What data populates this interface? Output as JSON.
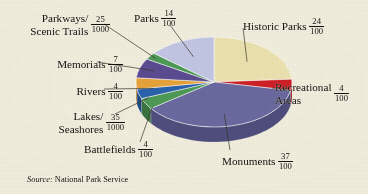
{
  "figure": {
    "background_color": "#f2efdf",
    "source_prefix": "Source:",
    "source_text": "National Park Service"
  },
  "chart_data": {
    "type": "pie",
    "title": "",
    "subtitle": "",
    "xlabel": "",
    "ylabel": "",
    "legend_position": "callout-labels",
    "grid": false,
    "three_d": true,
    "note": "Fractions of U.S. National Park System units by category; values given as printed fractions.",
    "categories": [
      "Historic Parks",
      "Recreational Areas",
      "Monuments",
      "Battlefields",
      "Lakes/ Seashores",
      "Rivers",
      "Memorials",
      "Parkways/ Scenic Trails",
      "Parks"
    ],
    "values": [
      0.24,
      0.04,
      0.37,
      0.04,
      0.035,
      0.04,
      0.07,
      0.025,
      0.14
    ],
    "labels_fraction": [
      "24/100",
      "4/100",
      "37/100",
      "4/100",
      "35/1000",
      "4/100",
      "7/100",
      "25/1000",
      "14/100"
    ],
    "colors": [
      "#ece3b0",
      "#cf2026",
      "#6b6aa0",
      "#4e9a56",
      "#2a62ad",
      "#e8a43a",
      "#5b4b91",
      "#4e9a56",
      "#c3c6e4"
    ],
    "slices": [
      {
        "name": "Historic Parks",
        "numerator": "24",
        "denominator": "100",
        "value": 0.24,
        "color": "#ece3b0",
        "side_color": "#d6cb92"
      },
      {
        "name": "Recreational Areas",
        "name_line1": "Recreational",
        "name_line2": "Areas",
        "numerator": "4",
        "denominator": "100",
        "value": 0.04,
        "color": "#cf2026",
        "side_color": "#9c161b"
      },
      {
        "name": "Monuments",
        "numerator": "37",
        "denominator": "100",
        "value": 0.37,
        "color": "#6b6aa0",
        "side_color": "#4f4e7d"
      },
      {
        "name": "Battlefields",
        "numerator": "4",
        "denominator": "100",
        "value": 0.04,
        "color": "#4e9a56",
        "side_color": "#3a7440"
      },
      {
        "name": "Lakes/ Seashores",
        "name_line1": "Lakes/",
        "name_line2": "Seashores",
        "numerator": "35",
        "denominator": "1000",
        "value": 0.035,
        "color": "#2a62ad",
        "side_color": "#1f4a84"
      },
      {
        "name": "Rivers",
        "numerator": "4",
        "denominator": "100",
        "value": 0.04,
        "color": "#e8a43a",
        "side_color": "#b87c26"
      },
      {
        "name": "Memorials",
        "numerator": "7",
        "denominator": "100",
        "value": 0.07,
        "color": "#5b4b91",
        "side_color": "#43376d"
      },
      {
        "name": "Parkways/ Scenic Trails",
        "name_line1": "Parkways/",
        "name_line2": "Scenic Trails",
        "numerator": "25",
        "denominator": "1000",
        "value": 0.025,
        "color": "#4e9a56",
        "side_color": "#3a7440"
      },
      {
        "name": "Parks",
        "numerator": "14",
        "denominator": "100",
        "value": 0.14,
        "color": "#c3c6e4",
        "side_color": "#9b9ec4"
      }
    ]
  }
}
